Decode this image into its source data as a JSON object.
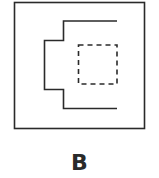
{
  "figure": {
    "label": "B",
    "stroke_color": "#2a2a2a",
    "background": "#ffffff",
    "elements": [
      {
        "name": "outer-square",
        "style": "solid"
      },
      {
        "name": "stepped-bracket-path",
        "style": "solid"
      },
      {
        "name": "inner-square",
        "style": "dashed"
      }
    ]
  }
}
